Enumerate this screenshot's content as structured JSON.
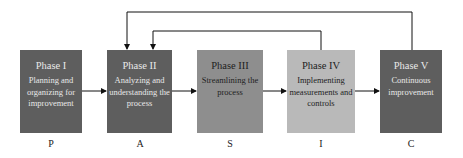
{
  "diagram": {
    "phases": [
      {
        "title": "Phase I",
        "desc": "Planning and organizing for improvement",
        "letter": "P",
        "fill": "#5e5e5e",
        "text_color": "#e8e8e8"
      },
      {
        "title": "Phase II",
        "desc": "Analyzing and understanding the process",
        "letter": "A",
        "fill": "#5e5e5e",
        "text_color": "#e8e8e8"
      },
      {
        "title": "Phase III",
        "desc": "Streamlining the process",
        "letter": "S",
        "fill": "#8e8e8e",
        "text_color": "#1e1e1e"
      },
      {
        "title": "Phase IV",
        "desc": "Implementing measurements and controls",
        "letter": "I",
        "fill": "#b9b9b9",
        "text_color": "#1e1e1e"
      },
      {
        "title": "Phase V",
        "desc": "Continuous improvement",
        "letter": "C",
        "fill": "#5e5e5e",
        "text_color": "#e8e8e8"
      }
    ],
    "connections": [
      {
        "from": "Phase I",
        "to": "Phase II",
        "type": "forward"
      },
      {
        "from": "Phase II",
        "to": "Phase III",
        "type": "forward"
      },
      {
        "from": "Phase III",
        "to": "Phase IV",
        "type": "forward"
      },
      {
        "from": "Phase IV",
        "to": "Phase V",
        "type": "forward"
      },
      {
        "from": "Phase V",
        "to": "Phase II",
        "type": "feedback"
      },
      {
        "from": "Phase IV",
        "to": "Phase II",
        "type": "feedback"
      }
    ]
  }
}
